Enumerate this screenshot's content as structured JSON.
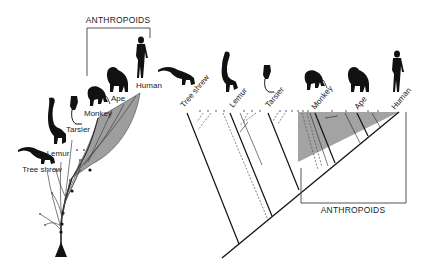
{
  "figure": {
    "left_panel": {
      "type": "branching evolutionary tree",
      "group_label": "ANTHROPOIDS",
      "taxa": [
        {
          "name": "Tree shrew",
          "icon": "tree-shrew-silhouette"
        },
        {
          "name": "Lemur",
          "icon": "lemur-silhouette"
        },
        {
          "name": "Tarsier",
          "icon": "tarsier-silhouette"
        },
        {
          "name": "Monkey",
          "icon": "monkey-silhouette"
        },
        {
          "name": "Ape",
          "icon": "ape-silhouette"
        },
        {
          "name": "Human",
          "icon": "human-silhouette"
        }
      ],
      "shaded_clade_color": "#9e9e9e"
    },
    "right_panel": {
      "type": "cladogram",
      "group_label": "ANTHROPOIDS",
      "taxa": [
        {
          "name": "Tree shrew",
          "icon": "tree-shrew-silhouette"
        },
        {
          "name": "Lemur",
          "icon": "lemur-silhouette"
        },
        {
          "name": "Tarsier",
          "icon": "tarsier-silhouette"
        },
        {
          "name": "Monkey",
          "icon": "monkey-silhouette"
        },
        {
          "name": "Ape",
          "icon": "ape-silhouette"
        },
        {
          "name": "Human",
          "icon": "human-silhouette"
        }
      ],
      "shaded_clade_color": "#a3a3a3"
    }
  }
}
